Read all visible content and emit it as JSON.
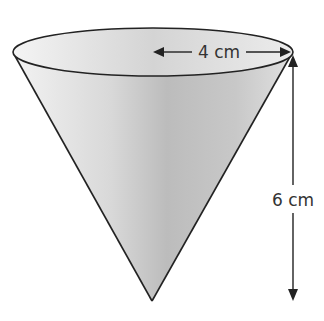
{
  "diagram": {
    "shape": "cone",
    "orientation": "apex-down",
    "labels": {
      "radius": "4 cm",
      "height": "6 cm"
    },
    "colors": {
      "outline": "#222222",
      "fill_light": "#e8e8e8",
      "fill_dark": "#a8a8a8",
      "text": "#333333"
    }
  }
}
